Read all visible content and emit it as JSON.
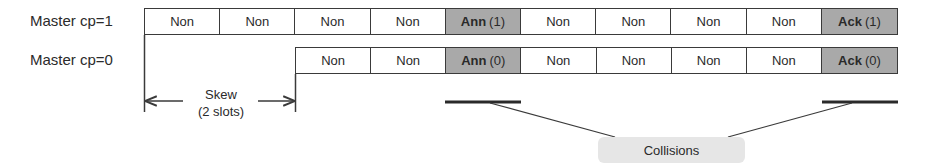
{
  "rows": [
    {
      "label": "Master cp=1",
      "cells": [
        {
          "main": "Non",
          "sub": "",
          "highlight": false
        },
        {
          "main": "Non",
          "sub": "",
          "highlight": false
        },
        {
          "main": "Non",
          "sub": "",
          "highlight": false
        },
        {
          "main": "Non",
          "sub": "",
          "highlight": false
        },
        {
          "main": "Ann",
          "sub": "(1)",
          "highlight": true
        },
        {
          "main": "Non",
          "sub": "",
          "highlight": false
        },
        {
          "main": "Non",
          "sub": "",
          "highlight": false
        },
        {
          "main": "Non",
          "sub": "",
          "highlight": false
        },
        {
          "main": "Non",
          "sub": "",
          "highlight": false
        },
        {
          "main": "Ack",
          "sub": "(1)",
          "highlight": true
        }
      ]
    },
    {
      "label": "Master cp=0",
      "cells": [
        {
          "main": "Non",
          "sub": "",
          "highlight": false
        },
        {
          "main": "Non",
          "sub": "",
          "highlight": false
        },
        {
          "main": "Ann",
          "sub": "(0)",
          "highlight": true
        },
        {
          "main": "Non",
          "sub": "",
          "highlight": false
        },
        {
          "main": "Non",
          "sub": "",
          "highlight": false
        },
        {
          "main": "Non",
          "sub": "",
          "highlight": false
        },
        {
          "main": "Non",
          "sub": "",
          "highlight": false
        },
        {
          "main": "Ack",
          "sub": "(0)",
          "highlight": true
        }
      ]
    }
  ],
  "skew": {
    "line1": "Skew",
    "line2": "(2 slots)"
  },
  "callout": {
    "label": "Collisions"
  },
  "colors": {
    "highlight": "#a9a9a9",
    "stroke": "#3a3a3a",
    "callout_bg": "#e6e6e6"
  }
}
